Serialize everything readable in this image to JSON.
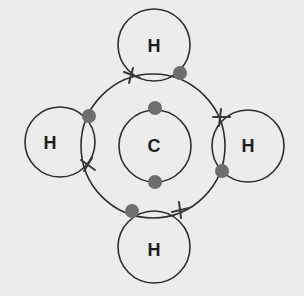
{
  "diagram": {
    "type": "dot-and-cross bonding diagram",
    "molecule_atoms": {
      "central": "C",
      "top": "H",
      "left": "H",
      "right": "H",
      "bottom": "H"
    },
    "legend_symbols": {
      "dot": "electron from one atom",
      "cross": "electron from the other atom"
    },
    "colors": {
      "background": "#ececec",
      "line": "#2e2e2e",
      "dot": "#6e6e6e",
      "cross": "#3a3a3a"
    }
  }
}
